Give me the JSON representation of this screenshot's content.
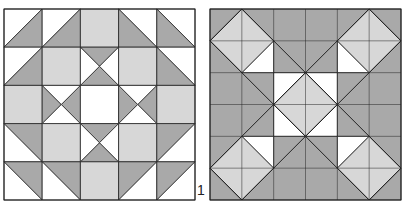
{
  "figure": {
    "label": "1",
    "colors": {
      "white": "#ffffff",
      "light": "#d7d7d7",
      "dark": "#a9a9a9",
      "line": "#222222"
    },
    "left_block": {
      "name": "quilt-block-left",
      "origin": [
        4,
        9
      ],
      "size": 191,
      "grid": 5,
      "cells": [
        [
          "hst-br",
          "hst-br",
          "light",
          "hst-bl",
          "hst-bl"
        ],
        [
          "hst-br",
          "light",
          "hg-v",
          "light",
          "hst-bl"
        ],
        [
          "light",
          "hg-h",
          "white",
          "hg-h",
          "light"
        ],
        [
          "hst-tr",
          "light",
          "hg-v",
          "light",
          "hst-tl"
        ],
        [
          "hst-tr",
          "hst-tr",
          "light",
          "hst-tl",
          "hst-tl"
        ]
      ]
    },
    "right_block": {
      "name": "quilt-block-right",
      "origin": [
        210,
        9
      ],
      "size": 191,
      "grid": 6
    }
  }
}
